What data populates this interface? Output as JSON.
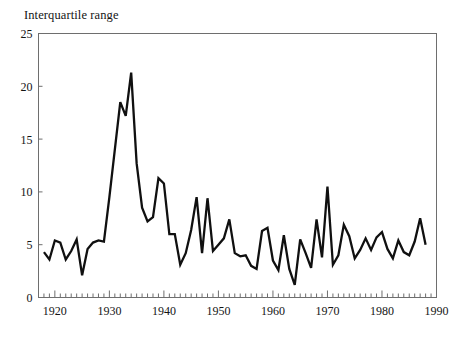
{
  "chart": {
    "title": "Interquartile range",
    "background": "#ffffff",
    "line_color": "#101010",
    "axis_color": "#6e6e6e",
    "text_color": "#141414"
  },
  "chart_data": {
    "type": "line",
    "title": "Interquartile range",
    "xlabel": "",
    "ylabel": "Interquartile range",
    "xlim": [
      1917,
      1990
    ],
    "ylim": [
      0,
      25
    ],
    "grid": false,
    "legend": false,
    "xticks": [
      1920,
      1930,
      1940,
      1950,
      1960,
      1970,
      1980,
      1990
    ],
    "xtick_labels": [
      "1920",
      "1930",
      "1940",
      "1950",
      "1960",
      "1970",
      "1980",
      "1990"
    ],
    "minor_xtick_interval": 1,
    "yticks": [
      0,
      5,
      10,
      15,
      20,
      25
    ],
    "ytick_labels": [
      "0",
      "5",
      "10",
      "15",
      "20",
      "25"
    ],
    "x": [
      1918,
      1919,
      1920,
      1921,
      1922,
      1923,
      1924,
      1925,
      1926,
      1927,
      1928,
      1929,
      1930,
      1931,
      1932,
      1933,
      1934,
      1935,
      1936,
      1937,
      1938,
      1939,
      1940,
      1941,
      1942,
      1943,
      1944,
      1945,
      1946,
      1947,
      1948,
      1949,
      1950,
      1951,
      1952,
      1953,
      1954,
      1955,
      1956,
      1957,
      1958,
      1959,
      1960,
      1961,
      1962,
      1963,
      1964,
      1965,
      1966,
      1967,
      1968,
      1969,
      1970,
      1971,
      1972,
      1973,
      1974,
      1975,
      1976,
      1977,
      1978,
      1979,
      1980,
      1981,
      1982,
      1983,
      1984,
      1985,
      1986,
      1987,
      1988
    ],
    "values": [
      4.3,
      3.6,
      5.4,
      5.2,
      3.6,
      4.4,
      5.5,
      2.1,
      4.6,
      5.2,
      5.4,
      5.3,
      9.5,
      14.0,
      18.5,
      17.2,
      21.3,
      12.7,
      8.5,
      7.2,
      7.6,
      11.3,
      10.8,
      6.0,
      6.0,
      3.1,
      4.2,
      6.4,
      9.5,
      4.2,
      9.4,
      4.4,
      5.0,
      5.6,
      7.4,
      4.2,
      3.9,
      4.0,
      3.0,
      2.7,
      6.3,
      6.6,
      3.5,
      2.6,
      5.9,
      2.7,
      1.2,
      5.5,
      4.2,
      2.8,
      7.4,
      3.8,
      10.5,
      3.1,
      4.0,
      6.9,
      5.8,
      3.7,
      4.5,
      5.6,
      4.5,
      5.7,
      6.2,
      4.6,
      3.7,
      5.4,
      4.3,
      4.0,
      5.3,
      7.5,
      5.0
    ],
    "series": [
      {
        "name": "Interquartile range",
        "values": [
          4.3,
          3.6,
          5.4,
          5.2,
          3.6,
          4.4,
          5.5,
          2.1,
          4.6,
          5.2,
          5.4,
          5.3,
          9.5,
          14.0,
          18.5,
          17.2,
          21.3,
          12.7,
          8.5,
          7.2,
          7.6,
          11.3,
          10.8,
          6.0,
          6.0,
          3.1,
          4.2,
          6.4,
          9.5,
          4.2,
          9.4,
          4.4,
          5.0,
          5.6,
          7.4,
          4.2,
          3.9,
          4.0,
          3.0,
          2.7,
          6.3,
          6.6,
          3.5,
          2.6,
          5.9,
          2.7,
          1.2,
          5.5,
          4.2,
          2.8,
          7.4,
          3.8,
          10.5,
          3.1,
          4.0,
          6.9,
          5.8,
          3.7,
          4.5,
          5.6,
          4.5,
          5.7,
          6.2,
          4.6,
          3.7,
          5.4,
          4.3,
          4.0,
          5.3,
          7.5,
          5.0
        ]
      }
    ]
  }
}
